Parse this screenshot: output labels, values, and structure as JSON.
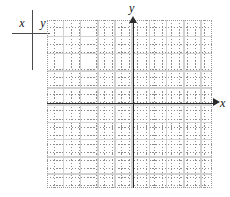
{
  "figure": {
    "kind": "blank-coordinate-plane-with-value-table",
    "background_color": "#ffffff"
  },
  "value_table": {
    "columns": [
      {
        "header": "x"
      },
      {
        "header": "y"
      }
    ],
    "rows": [],
    "rule_color": "#4a4a4a"
  },
  "chart_data": {
    "type": "scatter",
    "title": "",
    "xlabel": "x",
    "ylabel": "y",
    "x": [],
    "y": [],
    "series": [],
    "xlim": [
      -10,
      10
    ],
    "ylim": [
      -10,
      10
    ],
    "grid": true,
    "minor_grid": true,
    "major_grid_every": 2,
    "legend": "none",
    "axis_arrows": true,
    "annotations": []
  },
  "axes": {
    "x_label": "x",
    "y_label": "y",
    "line_color": "#2b2b2b",
    "minor_grid_color": "#8c8c8c",
    "major_grid_color": "#d2d2d2"
  }
}
